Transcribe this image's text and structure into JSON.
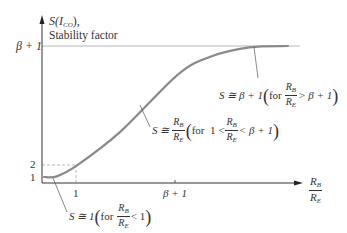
{
  "chart_data": {
    "type": "line",
    "title": "",
    "ylabel": "S(I_CO), Stability factor",
    "ylabel_line1_prefix": "S(",
    "ylabel_line1_var": "I",
    "ylabel_line1_sub": "CO",
    "ylabel_line1_suffix": "),",
    "ylabel_line2": "Stability factor",
    "xlabel_num": "R",
    "xlabel_num_sub": "B",
    "xlabel_den": "R",
    "xlabel_den_sub": "E",
    "x_ticks": [
      "1",
      "β + 1"
    ],
    "y_ticks": [
      "1",
      "2",
      "β + 1"
    ],
    "reference_lines": [
      {
        "label": "β + 1",
        "orientation": "horizontal",
        "style": "solid-thin"
      },
      {
        "label": "2 / 1",
        "orientation": "dashed-guides",
        "style": "dashed"
      }
    ],
    "series": [
      {
        "name": "S vs R_B/R_E",
        "description": "S ≅ 1 for R_B/R_E < 1, rises ≈ R_B/R_E in mid region, saturates at β+1",
        "points_normalized": [
          [
            0,
            0
          ],
          [
            0.05,
            0.005
          ],
          [
            0.13,
            0.09
          ],
          [
            0.3,
            0.35
          ],
          [
            0.52,
            0.78
          ],
          [
            0.65,
            0.92
          ],
          [
            0.8,
            0.99
          ],
          [
            0.95,
            1.0
          ]
        ]
      }
    ],
    "annotations": [
      {
        "id": "high",
        "text": "S ≅ β + 1 (for R_B/R_E > β + 1)"
      },
      {
        "id": "mid",
        "text": "S ≅ R_B/R_E (for 1 < R_B/R_E < β + 1)"
      },
      {
        "id": "low",
        "text": "S ≅ 1 (for R_B/R_E < 1)"
      }
    ]
  },
  "text": {
    "beta_plus_1": "β + 1",
    "one": "1",
    "two": "2",
    "S_approx": "S ≅",
    "S_approx_1": "S ≅ 1",
    "S_approx_beta": "S ≅ β + 1",
    "for": "for",
    "for_1_lt": "for  1 <",
    "lt_beta": "< β + 1",
    "gt_beta": "> β + 1",
    "lt_1": "< 1",
    "R": "R",
    "B": "B",
    "E": "E",
    "lparen": "(",
    "rparen": ")"
  }
}
